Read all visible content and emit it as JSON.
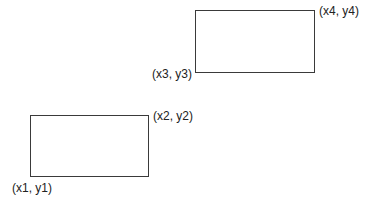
{
  "diagram": {
    "rectangles": [
      {
        "id": "rect-bottom-left",
        "corners": [
          "(x1, y1)",
          "(x2, y2)"
        ]
      },
      {
        "id": "rect-top-right",
        "corners": [
          "(x3, y3)",
          "(x4, y4)"
        ]
      }
    ],
    "labels": {
      "p1": "(x1, y1)",
      "p2": "(x2, y2)",
      "p3": "(x3, y3)",
      "p4": "(x4, y4)"
    },
    "colors": {
      "stroke": "#3a3a3a",
      "text": "#222222",
      "background": "#ffffff"
    }
  }
}
